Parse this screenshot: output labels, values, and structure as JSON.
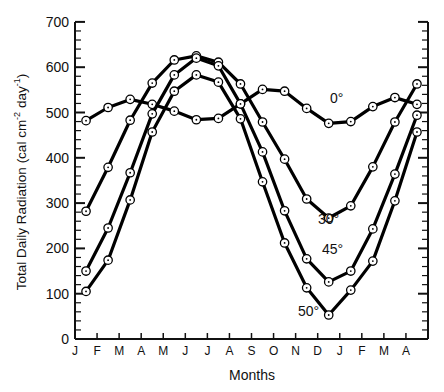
{
  "chart_data": {
    "type": "line",
    "title": "",
    "xlabel": "Months",
    "ylabel": "Total Daily Radiation (cal cm-2 day-1)",
    "ylabel_parts": {
      "main": "Total  Daily  Radiation  (cal  cm",
      "sup1": "-2",
      "mid": "  day",
      "sup2": "-1",
      "end": ")"
    },
    "ylim": [
      0,
      700
    ],
    "yticks": [
      0,
      100,
      200,
      300,
      400,
      500,
      600,
      700
    ],
    "xtick_labels": [
      "J",
      "F",
      "M",
      "A",
      "M",
      "J",
      "J",
      "A",
      "S",
      "O",
      "N",
      "D",
      "J",
      "F",
      "M",
      "A"
    ],
    "grid": false,
    "legend": "inline labels",
    "categories": [
      "Jan",
      "Feb",
      "Mar",
      "Apr",
      "May",
      "Jun",
      "Jul",
      "Aug",
      "Sep",
      "Oct",
      "Nov",
      "Dec",
      "Jan",
      "Feb",
      "Mar",
      "Apr"
    ],
    "series": [
      {
        "name": "0°",
        "label_pos": [
          330,
          103
        ],
        "values": [
          482,
          511,
          529,
          518,
          503,
          484,
          487,
          519,
          551,
          547,
          509,
          476,
          480,
          513,
          533,
          518
        ]
      },
      {
        "name": "30°",
        "label_pos": [
          318,
          224
        ],
        "values": [
          282,
          379,
          483,
          565,
          616,
          625,
          611,
          563,
          479,
          397,
          309,
          267,
          294,
          380,
          479,
          563
        ]
      },
      {
        "name": "45°",
        "label_pos": [
          322,
          254
        ],
        "values": [
          150,
          245,
          367,
          497,
          583,
          620,
          603,
          519,
          413,
          283,
          177,
          126,
          150,
          243,
          364,
          494
        ]
      },
      {
        "name": "50°",
        "label_pos": [
          298,
          316
        ],
        "values": [
          105,
          174,
          307,
          457,
          547,
          583,
          567,
          486,
          347,
          212,
          113,
          53,
          108,
          172,
          305,
          457
        ]
      }
    ]
  }
}
